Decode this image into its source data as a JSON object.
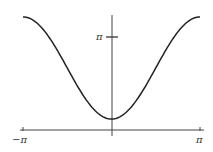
{
  "chart_data": {
    "type": "line",
    "title": "",
    "xlabel": "",
    "ylabel": "",
    "x_tick_labels": [
      "−π",
      "π"
    ],
    "y_tick_labels": [
      "π"
    ],
    "xlim": [
      -3.1416,
      3.1416
    ],
    "ylim": [
      0,
      3.9
    ],
    "grid": false,
    "legend": null,
    "series": [
      {
        "name": "f(x)",
        "x": [
          -3.1416,
          -2.618,
          -2.0944,
          -1.5708,
          -1.0472,
          -0.5236,
          0,
          0.5236,
          1.0472,
          1.5708,
          2.0944,
          2.618,
          3.1416
        ],
        "y": [
          3.82,
          3.59,
          2.96,
          2.1,
          1.23,
          0.6,
          0.37,
          0.6,
          1.23,
          2.1,
          2.96,
          3.59,
          3.82
        ]
      }
    ],
    "axes": {
      "x_axis_px": {
        "y": 130,
        "x_start": 20,
        "x_end": 204
      },
      "y_axis_px": {
        "x": 112,
        "y_start": 15,
        "y_end": 136
      }
    }
  },
  "labels": {
    "neg_pi": "−π",
    "pos_pi": "π",
    "y_pi": "π"
  }
}
